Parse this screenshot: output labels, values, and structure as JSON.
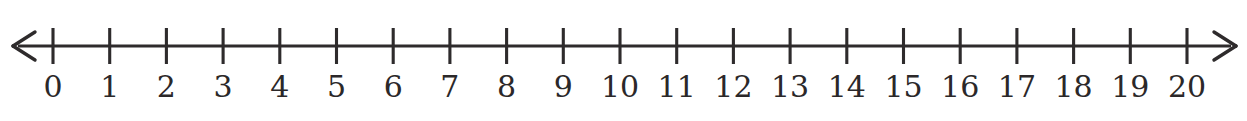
{
  "figure": {
    "background_color": "#ffffff",
    "ink_color": "#2e2b2c",
    "label_color": "#2b2829"
  },
  "chart_data": {
    "type": "line",
    "xlabel": "",
    "ylabel": "",
    "orientation": "horizontal",
    "grid": false,
    "legend": false,
    "xlim": [
      0,
      20
    ],
    "tick_interval": 1,
    "arrows": {
      "left": "left-arrowhead",
      "right": "right-arrowhead",
      "style": "open-chevron",
      "both_ends": true
    },
    "categories": [
      "0",
      "1",
      "2",
      "3",
      "4",
      "5",
      "6",
      "7",
      "8",
      "9",
      "10",
      "11",
      "12",
      "13",
      "14",
      "15",
      "16",
      "17",
      "18",
      "19",
      "20"
    ],
    "values": [
      0,
      1,
      2,
      3,
      4,
      5,
      6,
      7,
      8,
      9,
      10,
      11,
      12,
      13,
      14,
      15,
      16,
      17,
      18,
      19,
      20
    ],
    "tick_labels": [
      "0",
      "1",
      "2",
      "3",
      "4",
      "5",
      "6",
      "7",
      "8",
      "9",
      "10",
      "11",
      "12",
      "13",
      "14",
      "15",
      "16",
      "17",
      "18",
      "19",
      "20"
    ],
    "marked_points": [],
    "annotations": []
  },
  "geometry": {
    "axis_y": 46,
    "axis_x_start": 18,
    "axis_x_end": 1231,
    "first_tick_x": 53,
    "tick_spacing": 56.7,
    "tick_top": 28,
    "tick_bottom": 64,
    "label_baseline_y": 97,
    "left_arrow_tip_x": 13,
    "right_arrow_tip_x": 1236
  }
}
